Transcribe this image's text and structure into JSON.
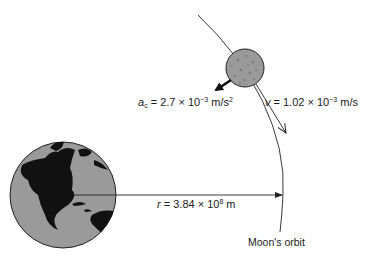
{
  "diagram": {
    "labels": {
      "acceleration": {
        "symbol": "a",
        "subscript": "c",
        "equals": " = 2.7 × 10",
        "exponent": "−3",
        "unit": " m/s",
        "unit_exponent": "2"
      },
      "velocity": {
        "symbol": "v",
        "equals": " = 1.02 × 10",
        "exponent": "−3",
        "unit": " m/s"
      },
      "radius": {
        "symbol": "r",
        "equals": " = 3.84 × 10",
        "exponent": "8",
        "unit": " m"
      },
      "orbit": "Moon's orbit"
    },
    "objects": {
      "earth": "Earth",
      "moon": "Moon"
    },
    "colors": {
      "body_fill": "#9a9a9a",
      "continent": "#111111",
      "line": "#222222"
    }
  }
}
